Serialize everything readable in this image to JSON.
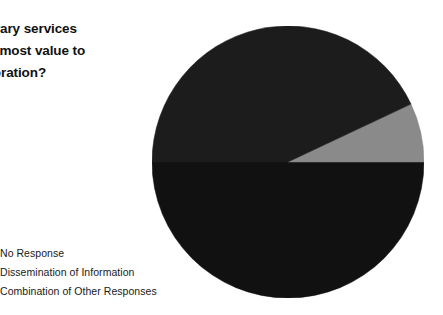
{
  "title": {
    "lines": [
      "at library services",
      "d the most value to",
      "corporation?"
    ],
    "full_text_visible": "at library services d the most value to corporation?"
  },
  "legend": {
    "position": "bottom-left",
    "items": [
      {
        "label": "No Response",
        "color": "#111111"
      },
      {
        "label": "Dissemination of Information",
        "color": "#8a8a8a"
      },
      {
        "label": "Combination of Other Responses",
        "color": "#1c1c1c"
      }
    ]
  },
  "chart_data": {
    "type": "pie",
    "title": "at library services d the most value to corporation?",
    "categories": [
      "No Response",
      "Dissemination of Information",
      "Combination of Other Responses"
    ],
    "values": [
      50,
      7,
      43
    ],
    "units": "percent",
    "colors": [
      "#111111",
      "#8a8a8a",
      "#1c1c1c"
    ],
    "start_angle_deg": 180,
    "direction": "counterclockwise",
    "legend": true,
    "grid": false,
    "labels_shown": false,
    "center_px": [
      288,
      162
    ],
    "radius_px": 136,
    "slices": [
      {
        "name": "No Response",
        "percent": 50,
        "angle_deg": 180,
        "color": "#111111"
      },
      {
        "name": "Dissemination of Information",
        "percent": 7,
        "angle_deg": 25,
        "color": "#8a8a8a"
      },
      {
        "name": "Combination of Other Responses",
        "percent": 43,
        "angle_deg": 155,
        "color": "#1c1c1c"
      }
    ]
  }
}
